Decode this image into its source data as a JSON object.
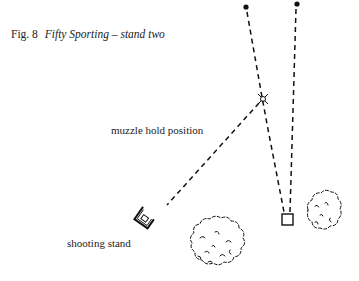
{
  "figure": {
    "number_label": "Fig. 8",
    "title": "Fifty Sporting – stand two"
  },
  "labels": {
    "muzzle_hold": "muzzle hold position",
    "shooting_stand": "shooting stand"
  },
  "elements": {
    "targets": [
      "target-end-point-left",
      "target-end-point-right"
    ],
    "trap": "trap-box",
    "bushes": [
      "bush-large-center",
      "bush-small-right"
    ]
  }
}
